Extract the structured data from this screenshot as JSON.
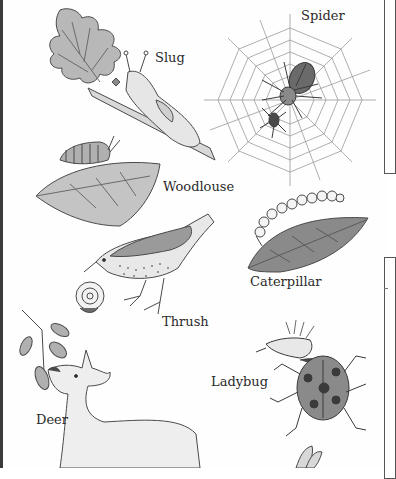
{
  "figure": {
    "labels": {
      "slug": "Slug",
      "spider": "Spider",
      "woodlouse": "Woodlouse",
      "caterpillar": "Caterpillar",
      "thrush": "Thrush",
      "deer": "Deer",
      "ladybug": "Ladybug"
    },
    "colors": {
      "ink": "#3a3a3a",
      "leaf_fill": "#b8b8b8",
      "body_fill": "#e6e6e6",
      "dark_fill": "#6a6a6a"
    }
  }
}
